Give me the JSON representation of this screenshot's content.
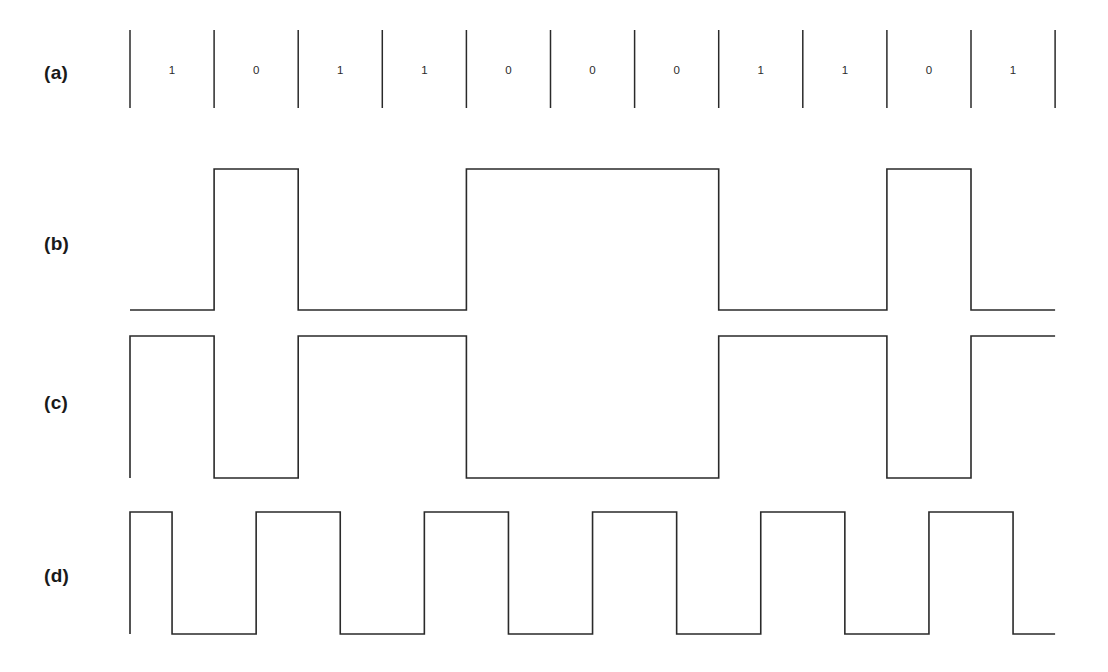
{
  "figure": {
    "ink_color": "#2a2a2a",
    "background_color": "#ffffff",
    "width": 1108,
    "height": 672
  },
  "rows": [
    {
      "label": "(a)",
      "name": "bit-sequence-row",
      "label_x": 44,
      "label_y": 62
    },
    {
      "label": "(b)",
      "name": "waveform-b-row",
      "label_x": 44,
      "label_y": 233
    },
    {
      "label": "(c)",
      "name": "waveform-c-row",
      "label_x": 44,
      "label_y": 392
    },
    {
      "label": "(d)",
      "name": "waveform-d-row",
      "label_x": 44,
      "label_y": 565
    }
  ],
  "chart_data": {
    "type": "line",
    "xlabel": "",
    "ylabel": "",
    "grid": false,
    "legend": "none",
    "bit_count": 11,
    "bits": [
      1,
      0,
      1,
      1,
      0,
      0,
      0,
      1,
      1,
      0,
      1
    ],
    "bit_string": "10110001101",
    "tick_count": 12,
    "cell_start_x": 130,
    "cell_width": 84.1,
    "ticks_x": [
      130.0,
      214.1,
      298.2,
      382.3,
      466.4,
      550.5,
      634.6,
      718.7,
      802.8,
      886.9,
      971.0,
      1055.1
    ],
    "series": [
      {
        "name": "(a) bit sequence",
        "row": "a",
        "kind": "labels",
        "tick_top_y": 30,
        "tick_bottom_y": 108,
        "label_y": 72,
        "values": [
          "1",
          "0",
          "1",
          "1",
          "0",
          "0",
          "0",
          "1",
          "1",
          "0",
          "1"
        ]
      },
      {
        "name": "(b) waveform",
        "row": "b",
        "kind": "level",
        "high_y": 169,
        "low_y": 310,
        "start_level": 0,
        "lead_in_x": 130,
        "lead_out_x": 1055,
        "levels": [
          0,
          1,
          0,
          0,
          1,
          1,
          1,
          0,
          0,
          1,
          0
        ],
        "leading_edge": false
      },
      {
        "name": "(c) waveform",
        "row": "c",
        "kind": "level",
        "high_y": 336,
        "low_y": 478,
        "start_level": 1,
        "lead_in_x": 140,
        "lead_out_x": 1055,
        "levels": [
          1,
          0,
          1,
          1,
          0,
          0,
          0,
          1,
          1,
          0,
          1
        ],
        "leading_edge": true
      },
      {
        "name": "(d) waveform",
        "row": "d",
        "kind": "manchester",
        "high_y": 512,
        "low_y": 634,
        "start_level": 1,
        "lead_in_x": 140,
        "lead_out_x": 1055,
        "leading_edge": true,
        "half_levels": [
          [
            1,
            0
          ],
          [
            0,
            1
          ],
          [
            1,
            0
          ],
          [
            0,
            1
          ],
          [
            1,
            0
          ],
          [
            0,
            1
          ],
          [
            1,
            0
          ],
          [
            0,
            1
          ],
          [
            1,
            0
          ],
          [
            0,
            1
          ],
          [
            1,
            0
          ]
        ]
      }
    ]
  }
}
